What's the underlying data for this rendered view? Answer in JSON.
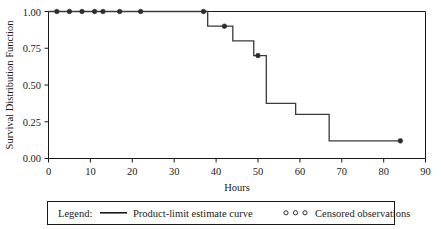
{
  "chart_data": {
    "type": "line",
    "title": "",
    "xlabel": "Hours",
    "ylabel": "Survival Distribution Function",
    "xlim": [
      0,
      90
    ],
    "ylim": [
      0.0,
      1.0
    ],
    "grid": false,
    "legend_position": "bottom",
    "x_ticks": [
      0,
      10,
      20,
      30,
      40,
      50,
      60,
      70,
      80,
      90
    ],
    "x_tick_labels": [
      "0",
      "10",
      "20",
      "30",
      "40",
      "50",
      "60",
      "70",
      "80",
      "90"
    ],
    "y_ticks": [
      0.0,
      0.25,
      0.5,
      0.75,
      1.0
    ],
    "y_tick_labels": [
      "0.00",
      "0.25",
      "0.50",
      "0.75",
      "1.00"
    ],
    "series": [
      {
        "name": "Product-limit estimate curve",
        "style": "step-post",
        "color": "#3a3a3a",
        "x": [
          0,
          38,
          38,
          44,
          44,
          49,
          49,
          52,
          52,
          59,
          59,
          67,
          67,
          84
        ],
        "y": [
          1.0,
          1.0,
          0.9,
          0.9,
          0.8,
          0.8,
          0.7,
          0.7,
          0.375,
          0.375,
          0.3,
          0.3,
          0.12,
          0.12
        ]
      }
    ],
    "censored": {
      "name": "Censored observations",
      "marker": "circle",
      "color": "#2b2b2b",
      "points": [
        {
          "x": 2,
          "y": 1.0
        },
        {
          "x": 5,
          "y": 1.0
        },
        {
          "x": 8,
          "y": 1.0
        },
        {
          "x": 11,
          "y": 1.0
        },
        {
          "x": 13,
          "y": 1.0
        },
        {
          "x": 17,
          "y": 1.0
        },
        {
          "x": 22,
          "y": 1.0
        },
        {
          "x": 37,
          "y": 1.0
        },
        {
          "x": 42,
          "y": 0.9
        },
        {
          "x": 50,
          "y": 0.7
        },
        {
          "x": 84,
          "y": 0.12
        }
      ]
    }
  },
  "axes": {
    "x_title": "Hours",
    "y_title": "Survival Distribution Function"
  },
  "legend": {
    "label": "Legend:",
    "curve_entry": "Product-limit estimate curve",
    "censored_entry": "Censored observations"
  }
}
